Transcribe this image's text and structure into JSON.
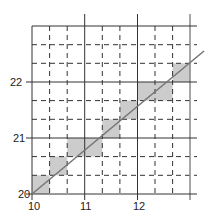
{
  "diagram": {
    "type": "staircase-line-on-grid",
    "x_axis": {
      "ticks": [
        "10",
        "11",
        "12"
      ],
      "min": 10,
      "max": 13,
      "subdivisions": 3
    },
    "y_axis": {
      "ticks": [
        "20",
        "21",
        "22"
      ],
      "min": 20,
      "max": 23,
      "subdivisions": 3
    },
    "line": {
      "from": [
        10,
        20
      ],
      "to": [
        13.25,
        22.55
      ]
    },
    "shaded_cells": [
      {
        "x0": 10,
        "x1": 10.333,
        "y0": 20,
        "y1": 20.333
      },
      {
        "x0": 10.333,
        "x1": 10.667,
        "y0": 20.333,
        "y1": 20.667
      },
      {
        "x0": 10.667,
        "x1": 11.333,
        "y0": 20.667,
        "y1": 21
      },
      {
        "x0": 11.333,
        "x1": 11.667,
        "y0": 21,
        "y1": 21.333
      },
      {
        "x0": 11.667,
        "x1": 12,
        "y0": 21.333,
        "y1": 21.667
      },
      {
        "x0": 12,
        "x1": 12.667,
        "y0": 21.667,
        "y1": 22
      },
      {
        "x0": 12.667,
        "x1": 13,
        "y0": 22,
        "y1": 22.333
      }
    ],
    "colors": {
      "grid": "#333333",
      "shade": "#cccccc",
      "line": "#777777"
    }
  }
}
